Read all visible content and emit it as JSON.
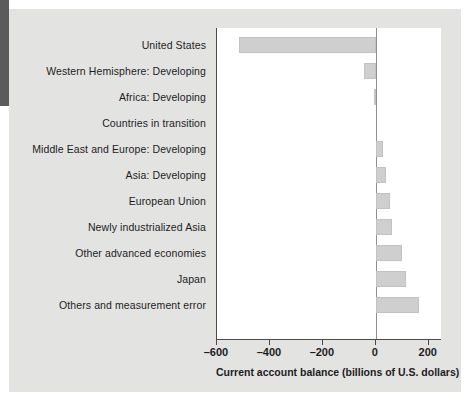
{
  "figure": {
    "background_color": "#e3e3e2",
    "plot_background_color": "#ffffff",
    "bar_color": "#cfcfcf",
    "axis_color": "#4a4a4a",
    "text_color": "#1d1d1d"
  },
  "chart_data": {
    "type": "bar",
    "orientation": "horizontal",
    "title": "",
    "subtitle": "",
    "xlabel": "Current account balance (billions of U.S. dollars)",
    "ylabel": "",
    "xlim": [
      -600,
      250
    ],
    "xticks": [
      -600,
      -400,
      -200,
      0,
      200
    ],
    "xticklabels": [
      "–600",
      "–400",
      "–200",
      "0",
      "200"
    ],
    "grid": false,
    "legend": null,
    "zero_reference_line": 0,
    "categories": [
      "United States",
      "Western Hemisphere: Developing",
      "Africa: Developing",
      "Countries in transition",
      "Middle East and Europe: Developing",
      "Asia: Developing",
      "European Union",
      "Newly industrialized Asia",
      "Other advanced economies",
      "Japan",
      "Others and measurement error"
    ],
    "values": [
      -518,
      -45,
      -7,
      0,
      26,
      40,
      52,
      60,
      100,
      115,
      165
    ],
    "units": "billions of U.S. dollars"
  },
  "axis": {
    "title": "Current account balance (billions of U.S. dollars)"
  }
}
